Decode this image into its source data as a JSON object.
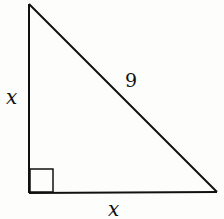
{
  "diagram": {
    "type": "right-triangle",
    "colors": {
      "stroke": "#111111",
      "background": "#fdfdfb"
    },
    "vertices": {
      "top": [
        29,
        4
      ],
      "right_angle": [
        29,
        193
      ],
      "bottom_right": [
        217,
        192
      ]
    },
    "right_angle_marker": {
      "x": 30,
      "y": 169,
      "size": 23
    },
    "labels": {
      "left_leg": "x",
      "hypotenuse": "9",
      "bottom_leg": "x"
    }
  }
}
